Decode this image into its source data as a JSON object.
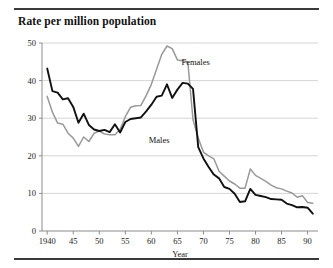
{
  "chart_title": "Rate per million population",
  "axes": {
    "x_label": "Year",
    "y_label": "",
    "x_ticklabels": [
      "1940",
      "45",
      "50",
      "55",
      "60",
      "65",
      "70",
      "75",
      "80",
      "85",
      "90"
    ],
    "x_tickvalues": [
      1940,
      1945,
      1950,
      1955,
      1960,
      1965,
      1970,
      1975,
      1980,
      1985,
      1990
    ],
    "y_ticklabels": [
      "0",
      "10",
      "20",
      "30",
      "40",
      "50"
    ],
    "y_tickvalues": [
      0,
      10,
      20,
      30,
      40,
      50
    ]
  },
  "series_labels": {
    "females": "Females",
    "males": "Males"
  },
  "colors": {
    "males_line": "#111111",
    "females_line": "#999999",
    "gridline": "#c9c9c9",
    "axis": "#8c8c8c",
    "rule": "#3a3a3a",
    "background": "#ffffff"
  },
  "chart_data": {
    "type": "line",
    "title": "Rate per million population",
    "xlabel": "Year",
    "ylabel": "Rate per million population",
    "xlim": [
      1939,
      1992
    ],
    "ylim": [
      0,
      50
    ],
    "grid": true,
    "legend": "inline-annotation",
    "x": [
      1940,
      1941,
      1942,
      1943,
      1944,
      1945,
      1946,
      1947,
      1948,
      1949,
      1950,
      1951,
      1952,
      1953,
      1954,
      1955,
      1956,
      1957,
      1958,
      1959,
      1960,
      1961,
      1962,
      1963,
      1964,
      1965,
      1966,
      1967,
      1968,
      1969,
      1970,
      1971,
      1972,
      1973,
      1974,
      1975,
      1976,
      1977,
      1978,
      1979,
      1980,
      1981,
      1982,
      1983,
      1984,
      1985,
      1986,
      1987,
      1988,
      1989,
      1990,
      1991
    ],
    "series": [
      {
        "name": "Males",
        "color": "#111111",
        "values": [
          43.2,
          37.2,
          36.8,
          35.0,
          35.3,
          33.0,
          28.8,
          31.2,
          28.2,
          27.0,
          26.6,
          26.9,
          26.3,
          28.4,
          26.2,
          29.0,
          29.8,
          30.0,
          30.2,
          31.8,
          33.6,
          35.7,
          36.0,
          39.0,
          35.4,
          37.6,
          39.4,
          39.2,
          37.8,
          22.3,
          19.3,
          17.0,
          15.0,
          14.0,
          11.7,
          11.2,
          9.9,
          7.7,
          7.9,
          11.2,
          9.6,
          9.3,
          9.0,
          8.5,
          8.4,
          8.3,
          7.3,
          6.9,
          6.3,
          6.4,
          6.2,
          4.6
        ]
      },
      {
        "name": "Females",
        "color": "#999999",
        "values": [
          35.8,
          31.6,
          28.7,
          28.4,
          26.0,
          24.7,
          22.5,
          25.0,
          23.8,
          26.0,
          26.6,
          25.8,
          25.6,
          25.6,
          27.0,
          30.4,
          32.9,
          33.3,
          33.4,
          36.0,
          39.0,
          43.0,
          47.0,
          49.2,
          48.5,
          45.5,
          45.3,
          45.0,
          29.6,
          24.7,
          21.0,
          20.0,
          19.2,
          15.9,
          14.6,
          13.3,
          12.5,
          11.4,
          11.4,
          16.5,
          14.8,
          14.0,
          13.2,
          12.2,
          11.5,
          11.2,
          10.6,
          10.1,
          9.0,
          9.4,
          7.6,
          7.4
        ]
      }
    ],
    "annotations": [
      {
        "text": "Females",
        "x": 1968.5,
        "y": 44.2
      },
      {
        "text": "Males",
        "x": 1961.5,
        "y": 23.5
      }
    ]
  }
}
